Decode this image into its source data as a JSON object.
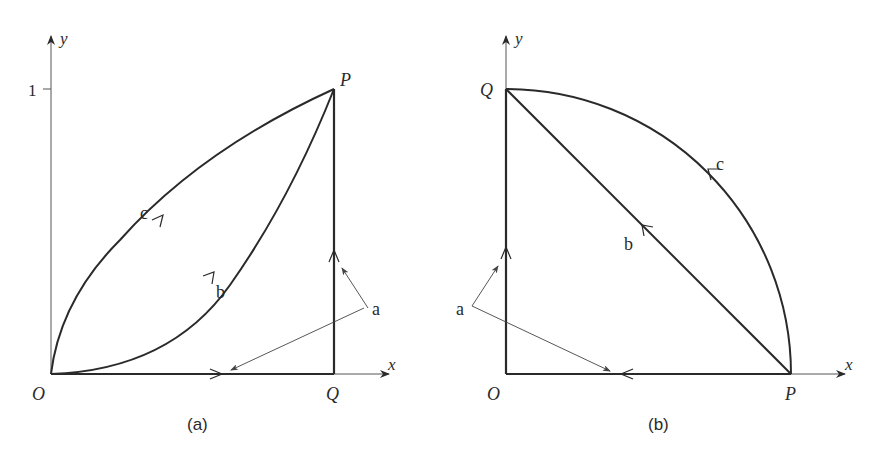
{
  "colors": {
    "ink": "#2a2a2a",
    "thin": "#555555",
    "background": "#ffffff"
  },
  "panels": [
    {
      "id": "a",
      "caption": "(a)",
      "axes": {
        "x_label": "x",
        "y_label": "y",
        "y_tick_label": "1"
      },
      "points": {
        "origin": "O",
        "P": "P",
        "Q": "Q"
      },
      "paths": [
        {
          "label": "a",
          "description": "O to Q along x-axis, then Q to P vertically"
        },
        {
          "label": "b",
          "description": "curve below diagonal (y = x^2 like) from O to P"
        },
        {
          "label": "c",
          "description": "curve above diagonal (y = sqrt(x) like) from O to P"
        }
      ]
    },
    {
      "id": "b",
      "caption": "(b)",
      "axes": {
        "x_label": "x",
        "y_label": "y"
      },
      "points": {
        "origin": "O",
        "P": "P",
        "Q": "Q"
      },
      "paths": [
        {
          "label": "a",
          "description": "P to O along x-axis, then O to Q along y-axis"
        },
        {
          "label": "b",
          "description": "straight line from P to Q"
        },
        {
          "label": "c",
          "description": "quarter-circle arc from P to Q"
        }
      ]
    }
  ]
}
